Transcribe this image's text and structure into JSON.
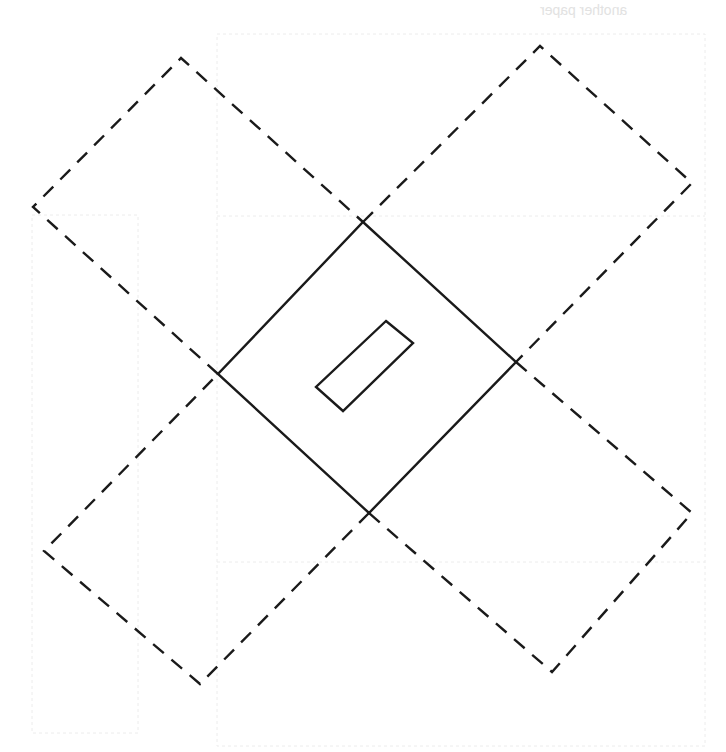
{
  "diagram": {
    "type": "fold pattern",
    "bleed_text": "another paper",
    "center_square": {
      "points": "363,222 516,362 369,513 218,374",
      "style": "solid"
    },
    "inner_slot": {
      "points": "386,321 413,343 343,411 316,387",
      "style": "solid"
    },
    "flaps": [
      {
        "name": "top-left",
        "points": "218,374 33,207 181,58 363,222",
        "style": "dashed"
      },
      {
        "name": "top-right",
        "points": "363,222 540,46 692,183 516,362",
        "style": "dashed"
      },
      {
        "name": "bottom-right",
        "points": "516,362 692,513 552,672 369,513",
        "style": "dashed"
      },
      {
        "name": "bottom-left",
        "points": "369,513 200,684 44,551 218,374",
        "style": "dashed"
      }
    ],
    "colors": {
      "line": "#1a1a1a",
      "background": "#ffffff",
      "ghost": "#e4e4e4"
    }
  }
}
